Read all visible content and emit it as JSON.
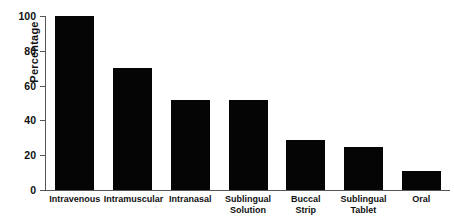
{
  "chart_data": {
    "type": "bar",
    "title": "",
    "xlabel": "",
    "ylabel": "Percentage",
    "ylim": [
      0,
      100
    ],
    "yticks": [
      0,
      20,
      40,
      60,
      80,
      100
    ],
    "ytick_labels": [
      "0",
      "20",
      "40",
      "60",
      "80",
      "100"
    ],
    "grid": false,
    "legend": null,
    "bar_color": "#050505",
    "axis_color": "#555555",
    "background_color": "#ffffff",
    "categories": [
      "Intravenous",
      "Intramuscular",
      "Intranasal",
      "Sublingual\nSolution",
      "Buccal\nStrip",
      "Sublingual\nTablet",
      "Oral"
    ],
    "values": [
      100,
      70,
      51.7,
      51.5,
      29,
      24.5,
      11
    ]
  }
}
